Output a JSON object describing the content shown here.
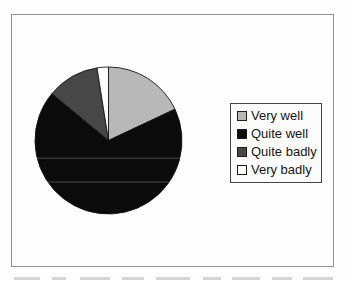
{
  "chart_data": {
    "type": "pie",
    "title": "",
    "categories": [
      "Very well",
      "Quite well",
      "Quite badly",
      "Very badly"
    ],
    "values": [
      18,
      68,
      11.5,
      2.5
    ],
    "unit": "percent",
    "values_are_estimates": true,
    "colors": [
      "#b8b8b8",
      "#0b0b0b",
      "#474747",
      "#fdfdfd"
    ],
    "start_angle_deg": 0,
    "direction": "clockwise",
    "legend_position": "right",
    "has_axes": false
  },
  "legend": {
    "items": [
      {
        "label": "Very well",
        "color": "#b8b8b8"
      },
      {
        "label": "Quite well",
        "color": "#0b0b0b"
      },
      {
        "label": "Quite badly",
        "color": "#474747"
      },
      {
        "label": "Very badly",
        "color": "#fdfdfd"
      }
    ]
  },
  "style": {
    "frame_border_color": "#8e9092",
    "legend_border_color": "#454545",
    "slice_outline_color": "#141414",
    "chart_background_color": "#fdfdfd"
  }
}
